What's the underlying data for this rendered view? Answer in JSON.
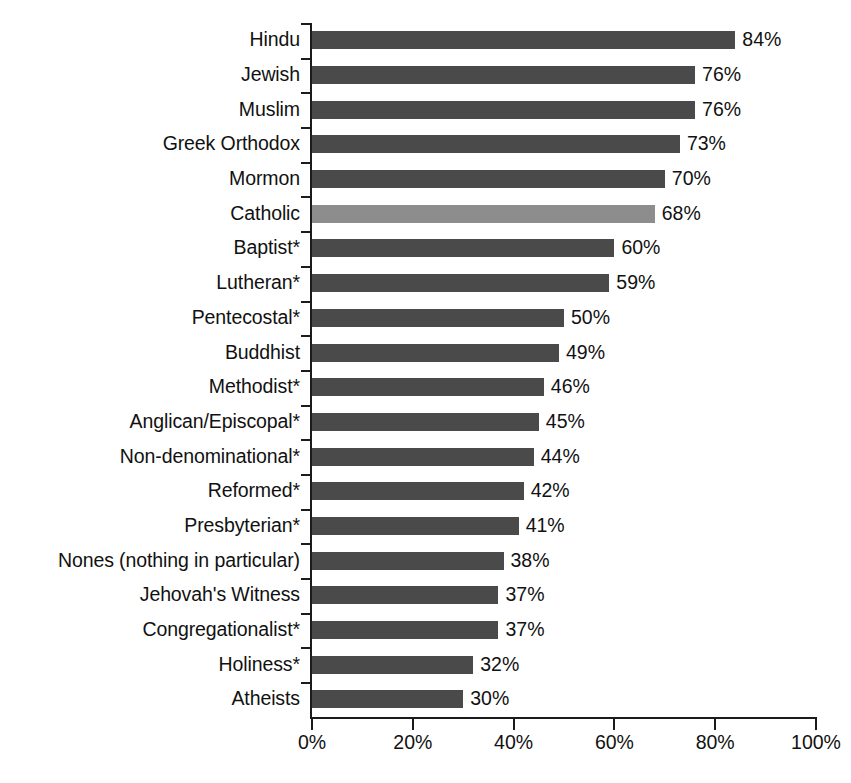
{
  "chart_data": {
    "type": "bar",
    "orientation": "horizontal",
    "title": "",
    "subtitle": "",
    "xlabel": "",
    "ylabel": "",
    "xlim": [
      0,
      100
    ],
    "grid": false,
    "legend": null,
    "value_suffix": "%",
    "colors": {
      "bar_default": "#4a4a4a",
      "bar_highlight": "#8d8d8d",
      "axis": "#1b1b1b",
      "text": "#111111",
      "background": "#ffffff"
    },
    "categories": [
      "Hindu",
      "Jewish",
      "Muslim",
      "Greek Orthodox",
      "Mormon",
      "Catholic",
      "Baptist*",
      "Lutheran*",
      "Pentecostal*",
      "Buddhist",
      "Methodist*",
      "Anglican/Episcopal*",
      "Non-denominational*",
      "Reformed*",
      "Presbyterian*",
      "Nones (nothing in particular)",
      "Jehovah's Witness",
      "Congregationalist*",
      "Holiness*",
      "Atheists"
    ],
    "values": [
      84,
      76,
      76,
      73,
      70,
      68,
      60,
      59,
      50,
      49,
      46,
      45,
      44,
      42,
      41,
      38,
      37,
      37,
      32,
      30
    ],
    "value_labels": [
      "84%",
      "76%",
      "76%",
      "73%",
      "70%",
      "68%",
      "60%",
      "59%",
      "50%",
      "49%",
      "46%",
      "45%",
      "44%",
      "42%",
      "41%",
      "38%",
      "37%",
      "37%",
      "32%",
      "30%"
    ],
    "highlighted_categories": [
      "Catholic"
    ],
    "xticks": [
      0,
      20,
      40,
      60,
      80,
      100
    ],
    "xtick_labels": [
      "0%",
      "20%",
      "40%",
      "60%",
      "80%",
      "100%"
    ]
  }
}
